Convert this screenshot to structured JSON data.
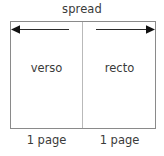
{
  "diagram": {
    "title": "spread",
    "top_label": "spread",
    "box": {
      "left_page": {
        "name": "verso",
        "label": "verso",
        "foot_label": "1 page"
      },
      "right_page": {
        "name": "recto",
        "label": "recto",
        "foot_label": "1 page"
      }
    },
    "arrows": {
      "left": {
        "direction": "left",
        "icon": "arrow-left-icon"
      },
      "right": {
        "direction": "right",
        "icon": "arrow-right-icon"
      }
    },
    "colors": {
      "background": "#ffffff",
      "box_border": "#8a8a8a",
      "gutter_line": "#b9b9b9",
      "text": "#3a3a3a",
      "arrow": "#1a1a1a"
    }
  }
}
